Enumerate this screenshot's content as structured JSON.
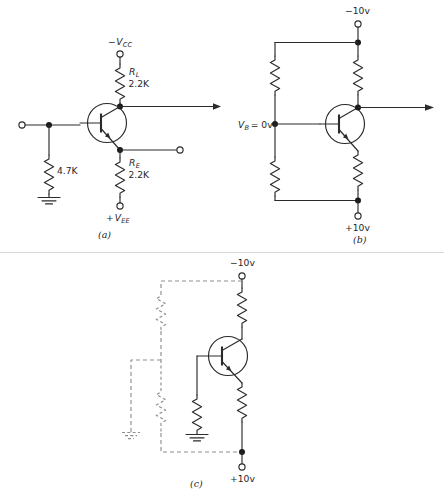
{
  "figure": {
    "background": "#ffffff",
    "wire_color": "#2b2b2b",
    "dashed_color": "#8d8d8d",
    "separator_color": "#d8d8d8",
    "width": 444,
    "height": 494
  },
  "panel_a": {
    "caption": "(a)",
    "supply_top": {
      "sign": "−",
      "name": "V",
      "subscript": "CC"
    },
    "supply_bottom": {
      "sign": "+",
      "name": "V",
      "subscript": "EE"
    },
    "collector_resistor": {
      "name": "R",
      "subscript": "L",
      "value": "2.2K"
    },
    "emitter_resistor": {
      "name": "R",
      "subscript": "E",
      "value": "2.2K"
    },
    "base_resistor": {
      "value": "4.7K"
    },
    "ground_label": "ground",
    "input_terminal": "input-terminal",
    "output_terminal": "output-terminal",
    "collector_arrow": "collector-output-arrow"
  },
  "panel_b": {
    "caption": "(b)",
    "supply_top": "−10v",
    "supply_bottom": "+10v",
    "base_label": {
      "name": "V",
      "subscript": "B",
      "value": "= 0v"
    },
    "collector_arrow": "collector-output-arrow"
  },
  "panel_c": {
    "caption": "(c)",
    "supply_top": "−10v",
    "supply_bottom": "+10v",
    "dashed_note": "original-divider-network-shown-dashed"
  }
}
